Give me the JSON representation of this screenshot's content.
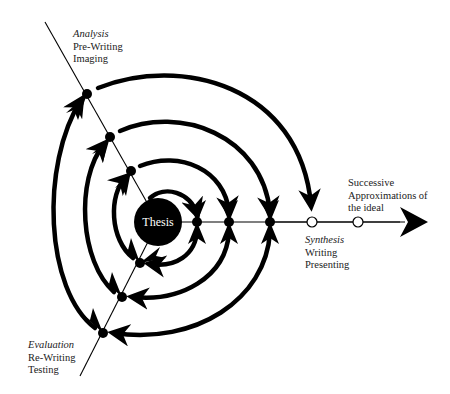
{
  "diagram": {
    "center": {
      "label": "Thesis"
    },
    "stages": {
      "analysis": {
        "title": "Analysis",
        "lines": [
          "Pre-Writing",
          "Imaging"
        ]
      },
      "synthesis": {
        "title": "Synthesis",
        "lines": [
          "Writing",
          "Presenting"
        ]
      },
      "evaluation": {
        "title": "Evaluation",
        "lines": [
          "Re-Writing",
          "Testing"
        ]
      }
    },
    "outcome": {
      "lines": [
        "Successive",
        "Approximations of",
        "the ideal"
      ]
    },
    "colors": {
      "ink": "#000000",
      "background": "#ffffff",
      "text": "#222222"
    }
  }
}
